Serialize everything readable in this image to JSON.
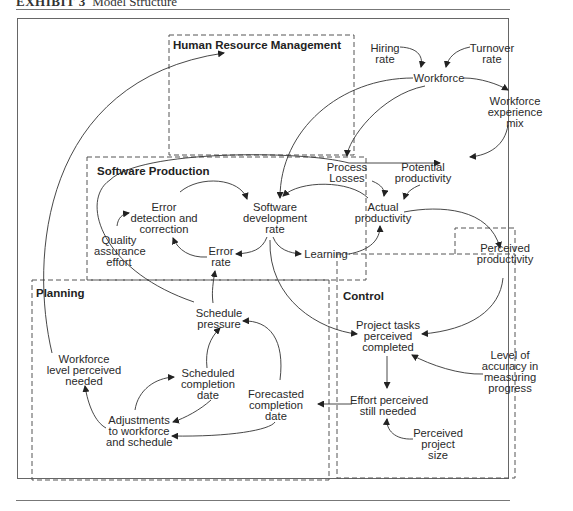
{
  "header": {
    "exhibit_label": "EXHIBIT 3",
    "exhibit_title": "Model Structure"
  },
  "sections": {
    "hrm": "Human Resource Management",
    "software_production": "Software Production",
    "planning": "Planning",
    "control": "Control"
  },
  "nodes": {
    "hiring_rate": [
      "Hiring",
      "rate"
    ],
    "turnover_rate": [
      "Turnover",
      "rate"
    ],
    "workforce": [
      "Workforce"
    ],
    "workforce_experience_mix": [
      "Workforce",
      "experience",
      "mix"
    ],
    "process_losses": [
      "Process",
      "Losses"
    ],
    "potential_productivity": [
      "Potential",
      "productivity"
    ],
    "actual_productivity": [
      "Actual",
      "productivity"
    ],
    "software_development_rate": [
      "Software",
      "development",
      "rate"
    ],
    "error_detection_correction": [
      "Error",
      "detection and",
      "correction"
    ],
    "quality_assurance_effort": [
      "Quality",
      "assurance",
      "effort"
    ],
    "error_rate": [
      "Error",
      "rate"
    ],
    "learning": [
      "Learning"
    ],
    "perceived_productivity": [
      "Perceived",
      "productivity"
    ],
    "schedule_pressure": [
      "Schedule",
      "pressure"
    ],
    "workforce_level_perceived_needed": [
      "Workforce",
      "level perceived",
      "needed"
    ],
    "scheduled_completion_date": [
      "Scheduled",
      "completion",
      "date"
    ],
    "forecasted_completion_date": [
      "Forecasted",
      "completion",
      "date"
    ],
    "adjustments": [
      "Adjustments",
      "to workforce",
      "and schedule"
    ],
    "project_tasks_perceived_completed": [
      "Project tasks",
      "perceived",
      "completed"
    ],
    "level_of_accuracy": [
      "Level of",
      "accuracy in",
      "measuring",
      "progress"
    ],
    "effort_perceived_still_needed": [
      "Effort perceived",
      "still needed"
    ],
    "perceived_project_size": [
      "Perceived",
      "project",
      "size"
    ]
  },
  "links": [
    {
      "from": "workforce_level_perceived_needed",
      "to": "hiring_rate"
    },
    {
      "from": "hiring_rate",
      "to": "workforce"
    },
    {
      "from": "turnover_rate",
      "to": "workforce"
    },
    {
      "from": "workforce",
      "to": "workforce_experience_mix"
    },
    {
      "from": "workforce",
      "to": "software_development_rate"
    },
    {
      "from": "workforce",
      "to": "process_losses"
    },
    {
      "from": "workforce_experience_mix",
      "to": "potential_productivity"
    },
    {
      "from": "schedule_pressure",
      "to": "potential_productivity"
    },
    {
      "from": "process_losses",
      "to": "actual_productivity"
    },
    {
      "from": "potential_productivity",
      "to": "actual_productivity"
    },
    {
      "from": "actual_productivity",
      "to": "software_development_rate"
    },
    {
      "from": "software_development_rate",
      "to": "learning"
    },
    {
      "from": "learning",
      "to": "actual_productivity"
    },
    {
      "from": "software_development_rate",
      "to": "error_rate"
    },
    {
      "from": "error_rate",
      "to": "error_detection_correction"
    },
    {
      "from": "error_detection_correction",
      "to": "software_development_rate"
    },
    {
      "from": "quality_assurance_effort",
      "to": "error_detection_correction"
    },
    {
      "from": "actual_productivity",
      "to": "perceived_productivity"
    },
    {
      "from": "perceived_productivity",
      "to": "project_tasks_perceived_completed"
    },
    {
      "from": "software_development_rate",
      "to": "project_tasks_perceived_completed"
    },
    {
      "from": "level_of_accuracy",
      "to": "project_tasks_perceived_completed"
    },
    {
      "from": "project_tasks_perceived_completed",
      "to": "effort_perceived_still_needed"
    },
    {
      "from": "perceived_project_size",
      "to": "effort_perceived_still_needed"
    },
    {
      "from": "effort_perceived_still_needed",
      "to": "forecasted_completion_date"
    },
    {
      "from": "forecasted_completion_date",
      "to": "schedule_pressure"
    },
    {
      "from": "forecasted_completion_date",
      "to": "adjustments"
    },
    {
      "from": "scheduled_completion_date",
      "to": "schedule_pressure"
    },
    {
      "from": "scheduled_completion_date",
      "to": "adjustments"
    },
    {
      "from": "adjustments",
      "to": "scheduled_completion_date"
    },
    {
      "from": "adjustments",
      "to": "workforce_level_perceived_needed"
    },
    {
      "from": "schedule_pressure",
      "to": "error_rate"
    }
  ]
}
